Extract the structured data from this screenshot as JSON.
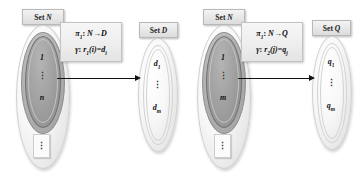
{
  "figure": {
    "type": "set-mapping-diagram",
    "panels": [
      {
        "id": "panel-left",
        "source_set": {
          "label_prefix": "Set",
          "label_symbol": "N",
          "elements": [
            "1",
            "⋮",
            "n"
          ],
          "outside_marker": "⋮"
        },
        "target_set": {
          "label_prefix": "Set",
          "label_symbol": "D",
          "elements": [
            "d",
            "⋮",
            "d"
          ],
          "element_subs": [
            "1",
            "",
            "m"
          ]
        },
        "formula_line1": "π₁: N → D",
        "formula_line2": "γ: r₁(i) = dᵢ",
        "formula_line1_parts": {
          "pi": "π",
          "pi_sub": "1",
          "sep": ": ",
          "domain": "N",
          "arrow": "→",
          "codomain": "D"
        },
        "formula_line2_parts": {
          "gamma": "γ",
          "sep": ": ",
          "r": "r",
          "r_sub": "1",
          "arg": "(i)",
          "eq": "=",
          "result": "d",
          "result_sub": "i"
        },
        "arrow": "maps-to"
      },
      {
        "id": "panel-right",
        "source_set": {
          "label_prefix": "Set",
          "label_symbol": "N",
          "elements": [
            "1",
            "⋮",
            "m"
          ],
          "outside_marker": "⋮"
        },
        "target_set": {
          "label_prefix": "Set",
          "label_symbol": "Q",
          "elements": [
            "q",
            "⋮",
            "q"
          ],
          "element_subs": [
            "1",
            "",
            "m"
          ]
        },
        "formula_line1": "π₁: N → Q",
        "formula_line2": "γ: r₂(j) = qⱼ",
        "formula_line1_parts": {
          "pi": "π",
          "pi_sub": "1",
          "sep": ": ",
          "domain": "N",
          "arrow": "→",
          "codomain": "Q"
        },
        "formula_line2_parts": {
          "gamma": "γ",
          "sep": ": ",
          "r": "r",
          "r_sub": "2",
          "arg": "(j)",
          "eq": "=",
          "result": "q",
          "result_sub": "j"
        },
        "arrow": "maps-to"
      }
    ],
    "colors": {
      "chip_fill": "#e9e9e9",
      "chip_border": "#b9b9b9",
      "outer_ellipse": "#f2f2f2",
      "mid_ellipse": "#b0b0b0",
      "inner_ellipse": "#9a9a9a",
      "arrow": "#111111",
      "text": "#111111"
    }
  }
}
